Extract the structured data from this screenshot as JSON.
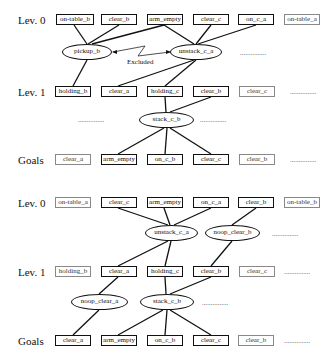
{
  "top_graph": {
    "levels": {
      "lev0": "Lev. 0",
      "lev1": "Lev. 1",
      "goals": "Goals"
    },
    "lev0_facts": [
      "on-table_b",
      "clear_b",
      "arm_empty",
      "clear_c",
      "on_c_a",
      "on-table_a"
    ],
    "actions0": [
      "pickup_b",
      "unstack_c_a"
    ],
    "mutex_label": "Excluded",
    "lev1_facts": [
      "holding_b",
      "clear_a",
      "holding_c",
      "clear_b",
      "clear_c"
    ],
    "actions1": [
      "stack_c_b"
    ],
    "goals": [
      "clear_a",
      "arm_empty",
      "on_c_b",
      "clear_c",
      "clear_b"
    ],
    "ellipsis": "..............."
  },
  "bottom_graph": {
    "levels": {
      "lev0": "Lev. 0",
      "lev1": "Lev. 1",
      "goals": "Goals"
    },
    "lev0_facts": [
      "on-table_a",
      "clear_c",
      "arm_empty",
      "on_c_a",
      "clear_b",
      "on-table_b"
    ],
    "actions0": [
      "unstack_c_a",
      "noop_clear_b"
    ],
    "lev1_facts": [
      "holding_b",
      "clear_a",
      "holding_c",
      "clear_b",
      "clear_c"
    ],
    "actions1": [
      "noop_clear_a",
      "stack_c_b"
    ],
    "goals": [
      "clear_a",
      "arm_empty",
      "on_c_b",
      "clear_c",
      "clear_b"
    ],
    "ellipsis": "..............."
  }
}
